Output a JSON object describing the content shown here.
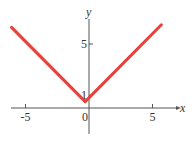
{
  "chart_data": {
    "type": "line",
    "title": "",
    "xlabel": "x",
    "ylabel": "y",
    "xlim": [
      -6.1,
      6.3
    ],
    "ylim": [
      -1.6,
      7.4
    ],
    "x_ticks": [
      {
        "value": -5,
        "label": "-5"
      },
      {
        "value": 0,
        "label": "0"
      },
      {
        "value": 5,
        "label": "5"
      }
    ],
    "y_ticks": [
      {
        "value": 1,
        "label": "1"
      },
      {
        "value": 5,
        "label": "5"
      }
    ],
    "series": [
      {
        "name": "V-shaped absolute value curve",
        "color": "#e8403a",
        "points": [
          [
            -6.1,
            6.3
          ],
          [
            -0.3,
            0.5
          ],
          [
            5.7,
            6.5
          ]
        ]
      }
    ],
    "grid": false,
    "legend": "none"
  }
}
